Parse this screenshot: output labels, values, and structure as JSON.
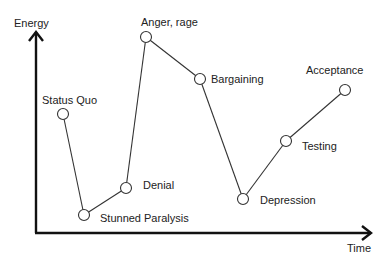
{
  "diagram": {
    "axes": {
      "y_label": "Energy",
      "x_label": "Time"
    },
    "stages": [
      {
        "label": "Status Quo",
        "x": 63,
        "y": 114,
        "lx": 42,
        "ly": 104
      },
      {
        "label": "Stunned Paralysis",
        "x": 84,
        "y": 215,
        "lx": 100,
        "ly": 222
      },
      {
        "label": "Denial",
        "x": 126,
        "y": 188,
        "lx": 143,
        "ly": 189
      },
      {
        "label": "Anger, rage",
        "x": 146,
        "y": 37,
        "lx": 141,
        "ly": 26
      },
      {
        "label": "Bargaining",
        "x": 200,
        "y": 79,
        "lx": 211,
        "ly": 83
      },
      {
        "label": "Depression",
        "x": 243,
        "y": 199,
        "lx": 260,
        "ly": 204
      },
      {
        "label": "Testing",
        "x": 286,
        "y": 141,
        "lx": 302,
        "ly": 150
      },
      {
        "label": "Acceptance",
        "x": 345,
        "y": 90,
        "lx": 306,
        "ly": 74
      }
    ]
  },
  "colors": {
    "axis": "#111111",
    "line": "#333333",
    "text": "#222222",
    "background": "#ffffff"
  }
}
